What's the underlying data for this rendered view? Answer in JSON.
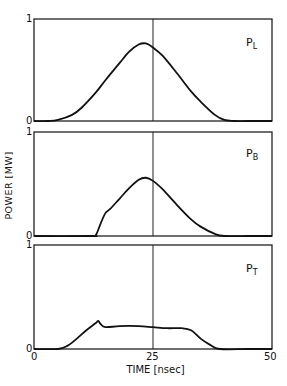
{
  "chart_data": [
    {
      "type": "line",
      "panel_label": "P_L",
      "label_main": "P",
      "label_sub": "L",
      "x": [
        0,
        3,
        5,
        8,
        10,
        13,
        15,
        18,
        20,
        22,
        23.5,
        25,
        27,
        30,
        33,
        35,
        38,
        40,
        42,
        45,
        50
      ],
      "values": [
        0,
        0,
        0.01,
        0.06,
        0.13,
        0.28,
        0.4,
        0.57,
        0.68,
        0.75,
        0.76,
        0.72,
        0.64,
        0.47,
        0.29,
        0.19,
        0.06,
        0.01,
        0,
        0,
        0
      ],
      "ylim": [
        0,
        1
      ],
      "xlim": [
        0,
        50
      ]
    },
    {
      "type": "line",
      "panel_label": "P_B",
      "label_main": "P",
      "label_sub": "B",
      "x": [
        0,
        12,
        13,
        14,
        15,
        16,
        18,
        20,
        22,
        23.5,
        25,
        27,
        30,
        33,
        35,
        38,
        40,
        45,
        50
      ],
      "values": [
        0,
        0,
        0.01,
        0.12,
        0.22,
        0.26,
        0.36,
        0.46,
        0.54,
        0.56,
        0.53,
        0.45,
        0.3,
        0.16,
        0.09,
        0.02,
        0,
        0,
        0
      ],
      "ylim": [
        0,
        1
      ],
      "xlim": [
        0,
        50
      ]
    },
    {
      "type": "line",
      "panel_label": "P_T",
      "label_main": "P",
      "label_sub": "T",
      "x": [
        0,
        5,
        7,
        9,
        11,
        13,
        13.5,
        14,
        15,
        18,
        22,
        25,
        28,
        31,
        33,
        35,
        37,
        39,
        45,
        50
      ],
      "values": [
        0,
        0,
        0.03,
        0.1,
        0.18,
        0.25,
        0.27,
        0.24,
        0.21,
        0.22,
        0.22,
        0.21,
        0.2,
        0.2,
        0.18,
        0.1,
        0.04,
        0,
        0,
        0
      ],
      "ylim": [
        0,
        1
      ],
      "xlim": [
        0,
        50
      ]
    }
  ],
  "axes": {
    "ylabel": "POWER [MW]",
    "xlabel": "TIME [nsec]",
    "x_ticks": [
      "0",
      "25",
      "50"
    ],
    "y_tick_top": "1",
    "y_tick_bottom": "0",
    "reference_line_x": 25
  }
}
